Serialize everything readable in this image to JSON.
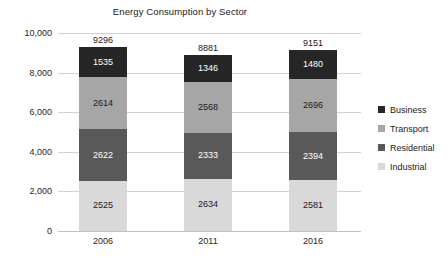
{
  "chart_data": {
    "type": "bar",
    "subtype": "stacked-column",
    "title": "Energy Consumption by Sector",
    "xlabel": "",
    "ylabel": "",
    "categories": [
      "2006",
      "2011",
      "2016"
    ],
    "series": [
      {
        "name": "Business",
        "color": "#262626",
        "label_color": "#ffffff",
        "values": [
          1535,
          1346,
          1480
        ]
      },
      {
        "name": "Transport",
        "color": "#a6a6a6",
        "label_color": "#1a1a1a",
        "values": [
          2614,
          2568,
          2696
        ]
      },
      {
        "name": "Residential",
        "color": "#595959",
        "label_color": "#ffffff",
        "values": [
          2622,
          2333,
          2394
        ]
      },
      {
        "name": "Industrial",
        "color": "#d9d9d9",
        "label_color": "#1a1a1a",
        "values": [
          2525,
          2634,
          2581
        ]
      }
    ],
    "stack_order_top_to_bottom": [
      "Business",
      "Transport",
      "Residential",
      "Industrial"
    ],
    "totals": [
      9296,
      8881,
      9151
    ],
    "total_labels": [
      "9296",
      "8881",
      "9151"
    ],
    "ylim": [
      0,
      10000
    ],
    "y_ticks": [
      0,
      2000,
      4000,
      6000,
      8000,
      10000
    ],
    "y_tick_labels": [
      "0",
      "2,000",
      "4,000",
      "6,000",
      "8,000",
      "10,000"
    ],
    "grid": true,
    "legend_position": "right",
    "legend_entries": [
      "Business",
      "Transport",
      "Residential",
      "Industrial"
    ]
  }
}
